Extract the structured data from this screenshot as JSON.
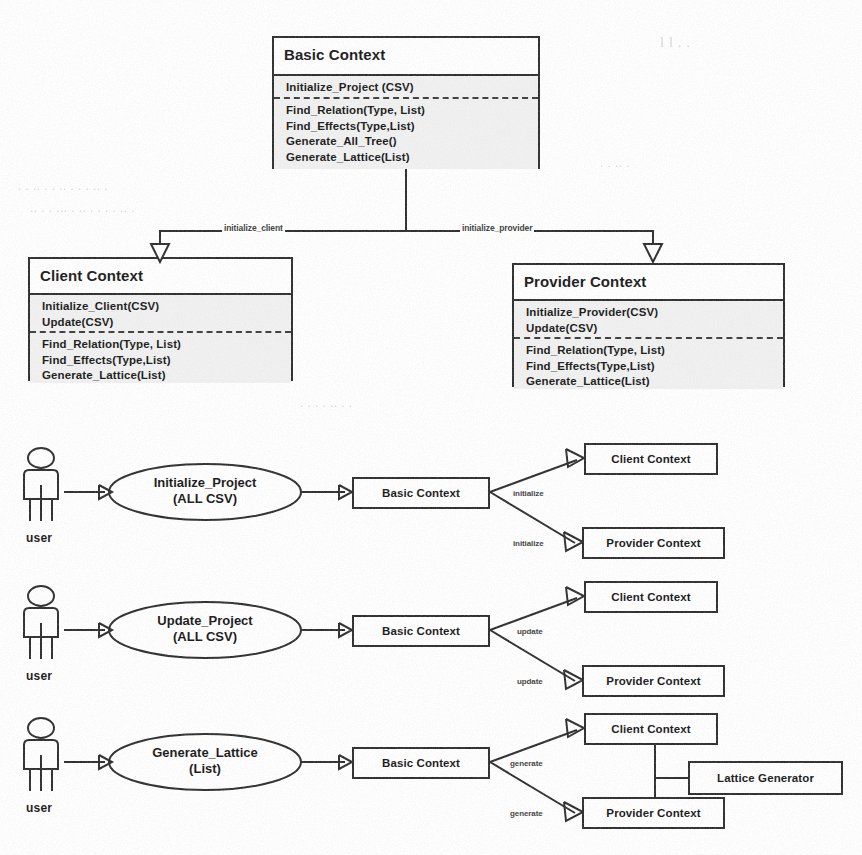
{
  "diagram": {
    "kind": "uml-class-and-usecase-diagram",
    "class_diagram": {
      "base_class": {
        "name": "Basic Context",
        "compartment_1": [
          "Initialize_Project (CSV)"
        ],
        "compartment_2": [
          "Find_Relation(Type, List)",
          "Find_Effects(Type,List)",
          "Generate_All_Tree()",
          "Generate_Lattice(List)"
        ]
      },
      "subclasses": [
        {
          "name": "Client Context",
          "compartment_1": [
            "Initialize_Client(CSV)",
            "Update(CSV)"
          ],
          "compartment_2": [
            "Find_Relation(Type, List)",
            "Find_Effects(Type,List)",
            "Generate_Lattice(List)"
          ]
        },
        {
          "name": "Provider Context",
          "compartment_1": [
            "Initialize_Provider(CSV)",
            "Update(CSV)"
          ],
          "compartment_2": [
            "Find_Relation(Type, List)",
            "Find_Effects(Type,List)",
            "Generate_Lattice(List)"
          ]
        }
      ],
      "inheritance_labels": {
        "left": "initialize_client",
        "right": "initialize_provider"
      }
    },
    "flows": [
      {
        "actor": "user",
        "use_case_line1": "Initialize_Project",
        "use_case_line2": "(ALL CSV)",
        "controller": "Basic Context",
        "edge_label_top": "initialize",
        "edge_label_bottom": "initialize",
        "target_top": "Client Context",
        "target_bottom": "Provider Context"
      },
      {
        "actor": "user",
        "use_case_line1": "Update_Project",
        "use_case_line2": "(ALL CSV)",
        "controller": "Basic Context",
        "edge_label_top": "update",
        "edge_label_bottom": "update",
        "target_top": "Client Context",
        "target_bottom": "Provider Context"
      },
      {
        "actor": "user",
        "use_case_line1": "Generate_Lattice",
        "use_case_line2": "(List)",
        "controller": "Basic Context",
        "edge_label_top": "generate",
        "edge_label_bottom": "generate",
        "target_top": "Client Context",
        "target_bottom": "Provider Context",
        "helper": "Lattice Generator"
      }
    ]
  },
  "colors": {
    "ink": "#2b2b2b",
    "compartment_fill": "#f1f1f1",
    "paper": "#ffffff"
  }
}
